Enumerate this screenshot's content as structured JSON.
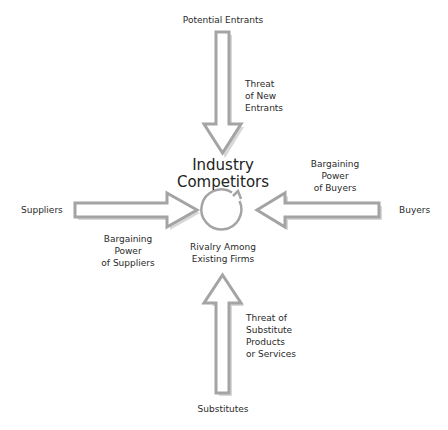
{
  "diagram": {
    "center": {
      "title_line1": "Industry",
      "title_line2": "Competitors",
      "rivalry_line1": "Rivalry Among",
      "rivalry_line2": "Existing Firms",
      "icon": "circular-arrow-icon"
    },
    "forces": {
      "top": {
        "source": "Potential Entrants",
        "label_lines": [
          "Threat",
          "of New",
          "Entrants"
        ],
        "direction": "down"
      },
      "left": {
        "source": "Suppliers",
        "label_lines": [
          "Bargaining",
          "Power",
          "of Suppliers"
        ],
        "direction": "right"
      },
      "right": {
        "source": "Buyers",
        "label_lines": [
          "Bargaining",
          "Power",
          "of Buyers"
        ],
        "direction": "left"
      },
      "bottom": {
        "source": "Substitutes",
        "label_lines": [
          "Threat of",
          "Substitute",
          "Products",
          "or Services"
        ],
        "direction": "up"
      }
    },
    "colors": {
      "arrow_stroke": "#a4a4a4",
      "arrow_fill": "#ffffff",
      "text": "#2a2a2a"
    }
  }
}
